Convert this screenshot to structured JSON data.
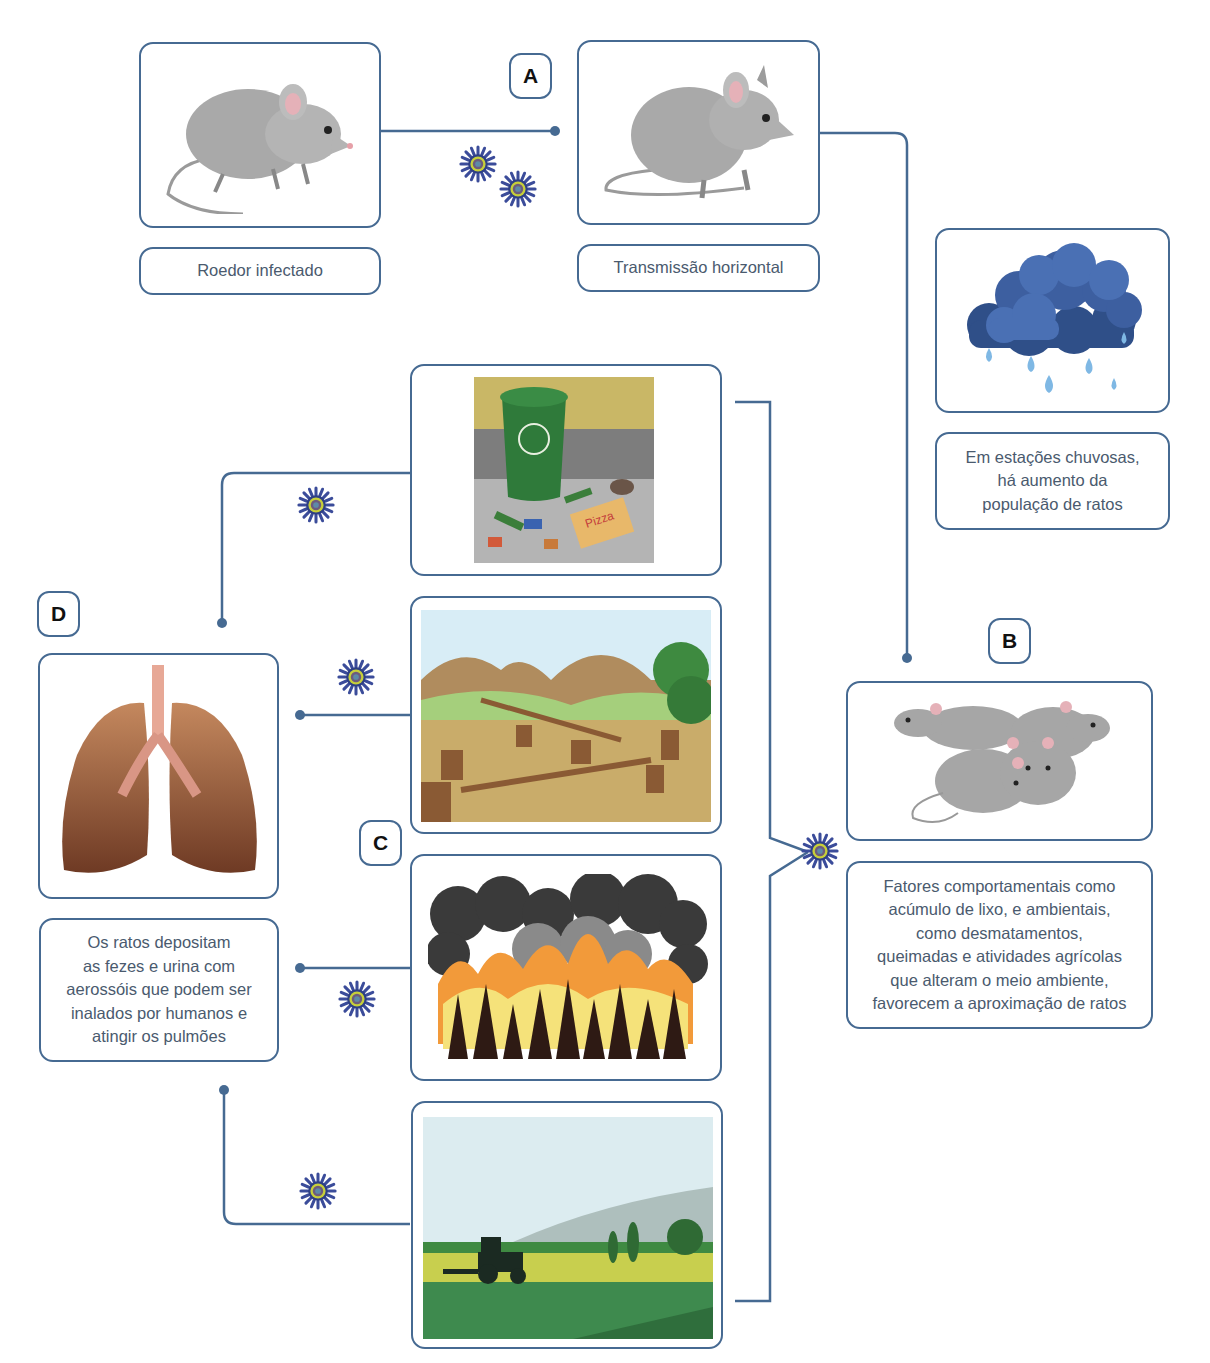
{
  "diagram": {
    "topic": "Ciclo de transmissão por roedores",
    "accent_color": "#466a92",
    "markers": {
      "a": "A",
      "b": "B",
      "c": "C",
      "d": "D"
    },
    "nodes": {
      "infected_rodent": {
        "label": "Roedor infectado",
        "icon": "mouse-illustration"
      },
      "horizontal_transmission": {
        "label": "Transmissão horizontal",
        "icon": "rat-illustration"
      },
      "rainy_season": {
        "icon": "rain-cloud-illustration",
        "lines": [
          "Em estações chuvosas,",
          "há aumento da",
          "população de ratos"
        ]
      },
      "rat_population": {
        "icon": "rat-group-illustration",
        "lines": [
          "Fatores comportamentais como",
          "acúmulo de lixo, e ambientais,",
          "como desmatamentos,",
          "queimadas e atividades agrícolas",
          "que alteram o meio ambiente,",
          "favorecem a aproximação de ratos"
        ]
      },
      "garbage": {
        "icon": "garbage-bin-illustration",
        "pizza_text": "Pizza"
      },
      "deforestation": {
        "icon": "deforestation-illustration"
      },
      "wildfire": {
        "icon": "wildfire-illustration"
      },
      "agriculture": {
        "icon": "tractor-field-illustration"
      },
      "lungs": {
        "icon": "lungs-illustration",
        "lines": [
          "Os ratos depositam",
          "as fezes e urina com",
          "aerossóis que podem ser",
          "inalados por humanos e",
          "atingir os pulmões"
        ]
      }
    },
    "virus_icon": "virus-icon"
  }
}
